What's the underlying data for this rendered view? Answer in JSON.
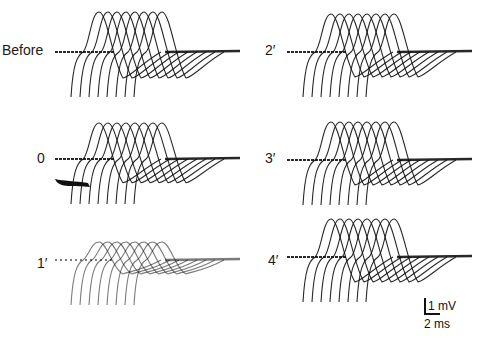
{
  "figure": {
    "panels": [
      {
        "id": "before",
        "label": "Before",
        "label_x": 2,
        "label_y": 43,
        "origin_x": 55,
        "baseline_y": 52,
        "sweeps": 8,
        "amplitude": 1.0,
        "dense_tail": true,
        "artifact": false
      },
      {
        "id": "0",
        "label": "0",
        "label_x": 37,
        "label_y": 151,
        "origin_x": 55,
        "baseline_y": 159,
        "sweeps": 8,
        "amplitude": 0.9,
        "dense_tail": true,
        "artifact": true
      },
      {
        "id": "1",
        "label": "1′",
        "label_x": 37,
        "label_y": 256,
        "origin_x": 55,
        "baseline_y": 260,
        "sweeps": 8,
        "amplitude": 0.45,
        "dense_tail": true,
        "artifact": false,
        "faint": true
      },
      {
        "id": "2",
        "label": "2′",
        "label_x": 265,
        "label_y": 43,
        "origin_x": 287,
        "baseline_y": 52,
        "sweeps": 8,
        "amplitude": 0.95,
        "dense_tail": true,
        "artifact": false
      },
      {
        "id": "3",
        "label": "3′",
        "label_x": 265,
        "label_y": 151,
        "origin_x": 287,
        "baseline_y": 160,
        "sweeps": 8,
        "amplitude": 0.95,
        "dense_tail": true,
        "artifact": false
      },
      {
        "id": "4",
        "label": "4′",
        "label_x": 268,
        "label_y": 253,
        "origin_x": 287,
        "baseline_y": 257,
        "sweeps": 8,
        "amplitude": 0.95,
        "dense_tail": true,
        "artifact": false
      }
    ],
    "scale_bar": {
      "voltage": "1 mV",
      "time": "2 ms"
    }
  },
  "colors": {
    "trace": "#111111",
    "background": "#ffffff"
  }
}
